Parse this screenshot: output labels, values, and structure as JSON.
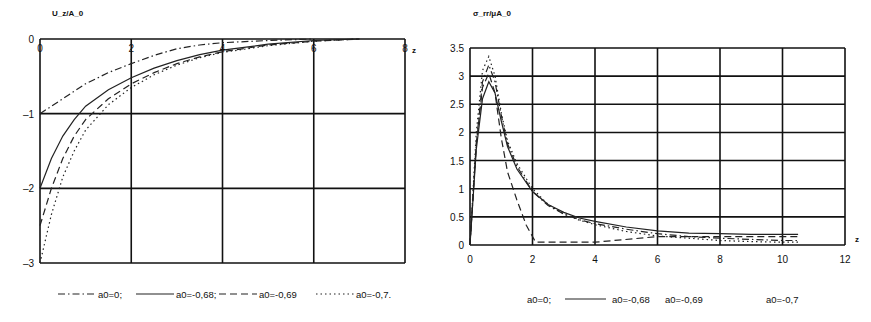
{
  "chart_data": [
    {
      "type": "line",
      "title": "",
      "ylabel": "U_z/A_0",
      "xlabel": "z",
      "xlim": [
        0,
        8
      ],
      "ylim": [
        -3,
        0
      ],
      "xticks": [
        "0",
        "2",
        "4",
        "6",
        "8"
      ],
      "yticks": [
        "0",
        "-1",
        "-2",
        "-3"
      ],
      "xtick_values": [
        0,
        2,
        4,
        6,
        8
      ],
      "ytick_values": [
        0,
        -1,
        -2,
        -3
      ],
      "grid": true,
      "legend_position": "bottom",
      "series": [
        {
          "name": "a0=0;",
          "style": "dashdot",
          "x": [
            0,
            0.5,
            1,
            1.5,
            2,
            2.5,
            3,
            3.5,
            4,
            5,
            6
          ],
          "y": [
            -1.0,
            -0.8,
            -0.6,
            -0.45,
            -0.33,
            -0.22,
            -0.13,
            -0.08,
            -0.05,
            -0.02,
            0
          ]
        },
        {
          "name": "a0=-0,68;",
          "style": "solid",
          "x": [
            0,
            0.25,
            0.5,
            0.75,
            1,
            1.5,
            2,
            2.5,
            3,
            3.5,
            4,
            5,
            6,
            7
          ],
          "y": [
            -2.0,
            -1.6,
            -1.3,
            -1.08,
            -0.9,
            -0.68,
            -0.52,
            -0.39,
            -0.29,
            -0.21,
            -0.15,
            -0.07,
            -0.02,
            0
          ]
        },
        {
          "name": "a0=-0,69",
          "style": "dashed",
          "x": [
            0,
            0.25,
            0.5,
            0.75,
            1,
            1.5,
            2,
            2.5,
            3,
            3.5,
            4,
            5,
            6,
            7
          ],
          "y": [
            -2.5,
            -2.0,
            -1.6,
            -1.3,
            -1.08,
            -0.8,
            -0.6,
            -0.45,
            -0.33,
            -0.24,
            -0.17,
            -0.08,
            -0.03,
            0
          ]
        },
        {
          "name": "a0=-0,7.",
          "style": "dotted",
          "x": [
            0,
            0.25,
            0.5,
            0.75,
            1,
            1.5,
            2,
            2.5,
            3,
            3.5,
            4,
            5,
            6,
            7
          ],
          "y": [
            -3.0,
            -2.35,
            -1.85,
            -1.5,
            -1.22,
            -0.88,
            -0.65,
            -0.48,
            -0.35,
            -0.25,
            -0.18,
            -0.09,
            -0.03,
            0
          ]
        }
      ]
    },
    {
      "type": "line",
      "title": "",
      "ylabel": "σ_rr/μA_0",
      "xlabel": "z",
      "xlim": [
        0,
        12
      ],
      "ylim": [
        0,
        3.5
      ],
      "xticks": [
        "0",
        "2",
        "4",
        "6",
        "8",
        "10",
        "12"
      ],
      "yticks": [
        "0",
        "0.5",
        "1",
        "1.5",
        "2",
        "2.5",
        "3",
        "3.5"
      ],
      "xtick_values": [
        0,
        2,
        4,
        6,
        8,
        10,
        12
      ],
      "ytick_values": [
        0,
        0.5,
        1,
        1.5,
        2,
        2.5,
        3,
        3.5
      ],
      "grid": true,
      "legend_position": "bottom",
      "series": [
        {
          "name": "a0=0;",
          "style": "dashdot",
          "x": [
            0,
            0.2,
            0.4,
            0.6,
            0.8,
            1.0,
            1.2,
            1.5,
            2.0,
            2.5,
            3,
            3.5,
            4,
            5,
            6,
            7,
            8,
            9,
            10,
            10.5
          ],
          "y": [
            0,
            1.8,
            2.9,
            3.2,
            2.9,
            2.3,
            1.8,
            1.4,
            0.95,
            0.7,
            0.55,
            0.45,
            0.38,
            0.28,
            0.2,
            0.15,
            0.12,
            0.1,
            0.08,
            0.08
          ]
        },
        {
          "name": "a0=-0,68",
          "style": "solid",
          "x": [
            0,
            0.2,
            0.4,
            0.6,
            0.8,
            1.0,
            1.2,
            1.5,
            2.0,
            2.5,
            3,
            3.5,
            4,
            5,
            6,
            7,
            8,
            9,
            10,
            10.5
          ],
          "y": [
            0,
            1.7,
            2.6,
            2.9,
            2.7,
            2.2,
            1.75,
            1.35,
            0.95,
            0.72,
            0.58,
            0.48,
            0.42,
            0.32,
            0.25,
            0.21,
            0.2,
            0.19,
            0.19,
            0.19
          ]
        },
        {
          "name": "a0=-0,69",
          "style": "dashed",
          "x": [
            0,
            0.2,
            0.4,
            0.6,
            0.8,
            1.0,
            1.2,
            1.5,
            1.8,
            2.1,
            3,
            4,
            6,
            8,
            10,
            10.5
          ],
          "y": [
            0,
            1.8,
            2.8,
            3.05,
            2.7,
            1.9,
            1.3,
            0.8,
            0.35,
            0.05,
            0.05,
            0.05,
            0.15,
            0.15,
            0.15,
            0.15
          ]
        },
        {
          "name": "a0=-0,7",
          "style": "dotted",
          "x": [
            0,
            0.2,
            0.4,
            0.6,
            0.8,
            1.0,
            1.2,
            1.5,
            2.0,
            2.5,
            3,
            3.5,
            4,
            5,
            6,
            7,
            8,
            9,
            10,
            10.5
          ],
          "y": [
            0,
            2.0,
            3.1,
            3.35,
            3.0,
            2.35,
            1.85,
            1.45,
            1.0,
            0.72,
            0.55,
            0.44,
            0.36,
            0.24,
            0.16,
            0.12,
            0.08,
            0.06,
            0.05,
            0.05
          ]
        }
      ]
    }
  ],
  "legends": {
    "left": [
      "a0=0;",
      "a0=-0,68;",
      "a0=-0,69",
      "a0=-0,7."
    ],
    "right": [
      "a0=0;",
      "a0=-0,68",
      "a0=-0,69",
      "a0=-0,7"
    ]
  }
}
